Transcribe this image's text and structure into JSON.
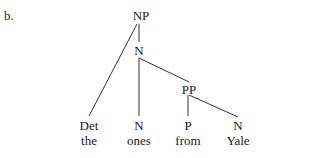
{
  "item_label": "b.",
  "tree": {
    "root": {
      "label": "NP"
    },
    "n_bar": {
      "label": "N"
    },
    "pp": {
      "label": "PP"
    },
    "leaves": [
      {
        "category": "Det",
        "word": "the"
      },
      {
        "category": "N",
        "word": "ones"
      },
      {
        "category": "P",
        "word": "from"
      },
      {
        "category": "N",
        "word": "Yale"
      }
    ]
  },
  "colors": {
    "text": "#1a1a1a",
    "edges": "#333333",
    "background": "#ffffff"
  }
}
